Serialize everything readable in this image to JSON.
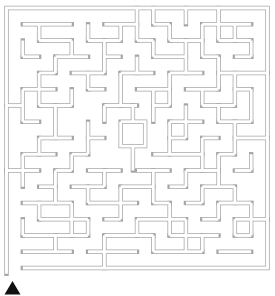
{
  "canvas": {
    "width": 275,
    "height": 296,
    "bg": "#ffffff"
  },
  "maze": {
    "cols": 16,
    "rows": 16,
    "x0": 6.5,
    "y0": 8,
    "cell_w": 16.3125,
    "cell_h": 16.25,
    "wall_color": "#a6a6a6",
    "wall_outer_width": 4.4,
    "wall_inner_width": 2.9,
    "border": [
      [
        0,
        16.35
      ],
      [
        0,
        0
      ],
      [
        16,
        0
      ],
      [
        16,
        16
      ],
      [
        1,
        16
      ]
    ],
    "polylines": [
      [
        [
          1,
          1
        ],
        [
          4,
          1
        ]
      ],
      [
        [
          6,
          1
        ],
        [
          8,
          1
        ]
      ],
      [
        [
          9,
          1
        ],
        [
          10,
          1
        ]
      ],
      [
        [
          12,
          1
        ],
        [
          15,
          1
        ]
      ],
      [
        [
          2,
          2
        ],
        [
          4,
          2
        ]
      ],
      [
        [
          5,
          2
        ],
        [
          7,
          2
        ]
      ],
      [
        [
          8,
          2
        ],
        [
          9,
          2
        ]
      ],
      [
        [
          10,
          2
        ],
        [
          12,
          2
        ]
      ],
      [
        [
          13,
          2
        ],
        [
          15,
          2
        ]
      ],
      [
        [
          1,
          3
        ],
        [
          2,
          3
        ]
      ],
      [
        [
          3,
          3
        ],
        [
          5,
          3
        ]
      ],
      [
        [
          6,
          3
        ],
        [
          7,
          3
        ]
      ],
      [
        [
          9,
          3
        ],
        [
          11,
          3
        ]
      ],
      [
        [
          12,
          3
        ],
        [
          13,
          3
        ]
      ],
      [
        [
          14,
          3
        ],
        [
          15,
          3
        ]
      ],
      [
        [
          2,
          4
        ],
        [
          3,
          4
        ]
      ],
      [
        [
          4,
          4
        ],
        [
          6,
          4
        ]
      ],
      [
        [
          7,
          4
        ],
        [
          9,
          4
        ]
      ],
      [
        [
          10,
          4
        ],
        [
          12,
          4
        ]
      ],
      [
        [
          13,
          4
        ],
        [
          16,
          4
        ]
      ],
      [
        [
          1,
          5
        ],
        [
          3,
          5
        ]
      ],
      [
        [
          5,
          5
        ],
        [
          6,
          5
        ]
      ],
      [
        [
          8,
          5
        ],
        [
          10,
          5
        ]
      ],
      [
        [
          11,
          5
        ],
        [
          13,
          5
        ]
      ],
      [
        [
          14,
          5
        ],
        [
          15,
          5
        ]
      ],
      [
        [
          0,
          6
        ],
        [
          1,
          6
        ]
      ],
      [
        [
          2,
          6
        ],
        [
          4,
          6
        ]
      ],
      [
        [
          6,
          6
        ],
        [
          8,
          6
        ]
      ],
      [
        [
          9,
          6
        ],
        [
          10,
          6
        ]
      ],
      [
        [
          12,
          6
        ],
        [
          14,
          6
        ]
      ],
      [
        [
          1,
          7
        ],
        [
          2,
          7
        ]
      ],
      [
        [
          10,
          7
        ],
        [
          12,
          7
        ]
      ],
      [
        [
          13,
          7
        ],
        [
          15,
          7
        ]
      ],
      [
        [
          2,
          8
        ],
        [
          4,
          8
        ]
      ],
      [
        [
          5,
          8
        ],
        [
          6,
          8
        ]
      ],
      [
        [
          10,
          8
        ],
        [
          11,
          8
        ]
      ],
      [
        [
          12,
          8
        ],
        [
          13,
          8
        ]
      ],
      [
        [
          14,
          8
        ],
        [
          16,
          8
        ]
      ],
      [
        [
          1,
          9
        ],
        [
          3,
          9
        ]
      ],
      [
        [
          4,
          9
        ],
        [
          5,
          9
        ]
      ],
      [
        [
          9,
          9
        ],
        [
          12,
          9
        ]
      ],
      [
        [
          13,
          9
        ],
        [
          14,
          9
        ]
      ],
      [
        [
          0,
          10
        ],
        [
          2,
          10
        ]
      ],
      [
        [
          3,
          10
        ],
        [
          4,
          10
        ]
      ],
      [
        [
          5,
          10
        ],
        [
          7,
          10
        ]
      ],
      [
        [
          8,
          10
        ],
        [
          10,
          10
        ]
      ],
      [
        [
          11,
          10
        ],
        [
          13,
          10
        ]
      ],
      [
        [
          14,
          10
        ],
        [
          15,
          10
        ]
      ],
      [
        [
          2,
          11
        ],
        [
          3,
          11
        ]
      ],
      [
        [
          4,
          11
        ],
        [
          6,
          11
        ]
      ],
      [
        [
          7,
          11
        ],
        [
          9,
          11
        ]
      ],
      [
        [
          10,
          11
        ],
        [
          11,
          11
        ]
      ],
      [
        [
          12,
          11
        ],
        [
          14,
          11
        ]
      ],
      [
        [
          1,
          12
        ],
        [
          4,
          12
        ]
      ],
      [
        [
          5,
          12
        ],
        [
          8,
          12
        ]
      ],
      [
        [
          9,
          12
        ],
        [
          10,
          12
        ]
      ],
      [
        [
          11,
          12
        ],
        [
          12,
          12
        ]
      ],
      [
        [
          13,
          12
        ],
        [
          15,
          12
        ]
      ],
      [
        [
          2,
          13
        ],
        [
          5,
          13
        ]
      ],
      [
        [
          6,
          13
        ],
        [
          7,
          13
        ]
      ],
      [
        [
          8,
          13
        ],
        [
          11,
          13
        ]
      ],
      [
        [
          12,
          13
        ],
        [
          13,
          13
        ]
      ],
      [
        [
          14,
          13
        ],
        [
          16,
          13
        ]
      ],
      [
        [
          1,
          14
        ],
        [
          5,
          14
        ]
      ],
      [
        [
          6,
          14
        ],
        [
          9,
          14
        ]
      ],
      [
        [
          10,
          14
        ],
        [
          13,
          14
        ]
      ],
      [
        [
          14,
          14
        ],
        [
          15,
          14
        ]
      ],
      [
        [
          1,
          15
        ],
        [
          4,
          15
        ]
      ],
      [
        [
          5,
          15
        ],
        [
          8,
          15
        ]
      ],
      [
        [
          9,
          15
        ],
        [
          12,
          15
        ]
      ],
      [
        [
          13,
          15
        ],
        [
          15,
          15
        ]
      ],
      [
        [
          1,
          2
        ],
        [
          1,
          3
        ]
      ],
      [
        [
          1,
          5
        ],
        [
          1,
          7
        ]
      ],
      [
        [
          1,
          9
        ],
        [
          1,
          11
        ]
      ],
      [
        [
          1,
          13
        ],
        [
          1,
          14
        ]
      ],
      [
        [
          2,
          1
        ],
        [
          2,
          2
        ]
      ],
      [
        [
          2,
          4
        ],
        [
          2,
          6
        ]
      ],
      [
        [
          2,
          8
        ],
        [
          2,
          9
        ]
      ],
      [
        [
          2,
          12
        ],
        [
          2,
          13
        ]
      ],
      [
        [
          3,
          3
        ],
        [
          3,
          4
        ]
      ],
      [
        [
          3,
          6
        ],
        [
          3,
          8
        ]
      ],
      [
        [
          3,
          10
        ],
        [
          3,
          12
        ]
      ],
      [
        [
          3,
          14
        ],
        [
          3,
          15
        ]
      ],
      [
        [
          4,
          2
        ],
        [
          4,
          3
        ]
      ],
      [
        [
          4,
          5
        ],
        [
          4,
          6
        ]
      ],
      [
        [
          4,
          9
        ],
        [
          4,
          10
        ]
      ],
      [
        [
          4,
          12
        ],
        [
          4,
          14
        ]
      ],
      [
        [
          5,
          1
        ],
        [
          5,
          2
        ]
      ],
      [
        [
          5,
          4
        ],
        [
          5,
          5
        ]
      ],
      [
        [
          5,
          7
        ],
        [
          5,
          9
        ]
      ],
      [
        [
          5,
          11
        ],
        [
          5,
          12
        ]
      ],
      [
        [
          5,
          13
        ],
        [
          5,
          14
        ]
      ],
      [
        [
          6,
          2
        ],
        [
          6,
          4
        ]
      ],
      [
        [
          6,
          6
        ],
        [
          6,
          7
        ]
      ],
      [
        [
          6,
          10
        ],
        [
          6,
          11
        ]
      ],
      [
        [
          6,
          14
        ],
        [
          6,
          16
        ]
      ],
      [
        [
          7,
          1
        ],
        [
          7,
          2
        ]
      ],
      [
        [
          7,
          4
        ],
        [
          7,
          6
        ]
      ],
      [
        [
          7,
          11
        ],
        [
          7,
          13
        ]
      ],
      [
        [
          8,
          0
        ],
        [
          8,
          2
        ]
      ],
      [
        [
          8,
          3
        ],
        [
          8,
          4
        ]
      ],
      [
        [
          8,
          13
        ],
        [
          8,
          14
        ]
      ],
      [
        [
          9,
          0
        ],
        [
          9,
          1
        ]
      ],
      [
        [
          9,
          2
        ],
        [
          9,
          3
        ]
      ],
      [
        [
          9,
          5
        ],
        [
          9,
          7
        ]
      ],
      [
        [
          9,
          10
        ],
        [
          9,
          12
        ]
      ],
      [
        [
          9,
          14
        ],
        [
          9,
          15
        ]
      ],
      [
        [
          10,
          1
        ],
        [
          10,
          2
        ]
      ],
      [
        [
          10,
          4
        ],
        [
          10,
          6
        ]
      ],
      [
        [
          10,
          7
        ],
        [
          10,
          9
        ]
      ],
      [
        [
          10,
          12
        ],
        [
          10,
          14
        ]
      ],
      [
        [
          11,
          0
        ],
        [
          11,
          1
        ]
      ],
      [
        [
          11,
          2
        ],
        [
          11,
          4
        ]
      ],
      [
        [
          11,
          6
        ],
        [
          11,
          8
        ]
      ],
      [
        [
          11,
          10
        ],
        [
          11,
          11
        ]
      ],
      [
        [
          11,
          13
        ],
        [
          11,
          15
        ]
      ],
      [
        [
          12,
          1
        ],
        [
          12,
          3
        ]
      ],
      [
        [
          12,
          5
        ],
        [
          12,
          6
        ]
      ],
      [
        [
          12,
          8
        ],
        [
          12,
          10
        ]
      ],
      [
        [
          12,
          11
        ],
        [
          12,
          12
        ]
      ],
      [
        [
          12,
          14
        ],
        [
          12,
          15
        ]
      ],
      [
        [
          13,
          0
        ],
        [
          13,
          2
        ]
      ],
      [
        [
          13,
          3
        ],
        [
          13,
          5
        ]
      ],
      [
        [
          13,
          6
        ],
        [
          13,
          7
        ]
      ],
      [
        [
          13,
          9
        ],
        [
          13,
          11
        ]
      ],
      [
        [
          13,
          12
        ],
        [
          13,
          13
        ]
      ],
      [
        [
          14,
          1
        ],
        [
          14,
          2
        ]
      ],
      [
        [
          14,
          4
        ],
        [
          14,
          6
        ]
      ],
      [
        [
          14,
          7
        ],
        [
          14,
          9
        ]
      ],
      [
        [
          14,
          11
        ],
        [
          14,
          12
        ]
      ],
      [
        [
          14,
          13
        ],
        [
          14,
          14
        ]
      ],
      [
        [
          15,
          2
        ],
        [
          15,
          3
        ]
      ],
      [
        [
          15,
          5
        ],
        [
          15,
          7
        ]
      ],
      [
        [
          15,
          9
        ],
        [
          15,
          10
        ]
      ],
      [
        [
          15,
          12
        ],
        [
          15,
          14
        ]
      ],
      [
        [
          7,
          7
        ],
        [
          8.5,
          7
        ],
        [
          8.5,
          8.5
        ],
        [
          7,
          8.5
        ],
        [
          7,
          7
        ]
      ],
      [
        [
          7.75,
          8.5
        ],
        [
          7.75,
          10
        ]
      ],
      [
        [
          7.75,
          6
        ],
        [
          7.75,
          7
        ]
      ]
    ]
  },
  "marker": {
    "shape": "triangle-up",
    "color": "#111111",
    "points_px": [
      [
        4.5,
        294.5
      ],
      [
        20.5,
        294.5
      ],
      [
        12.5,
        281
      ]
    ]
  }
}
